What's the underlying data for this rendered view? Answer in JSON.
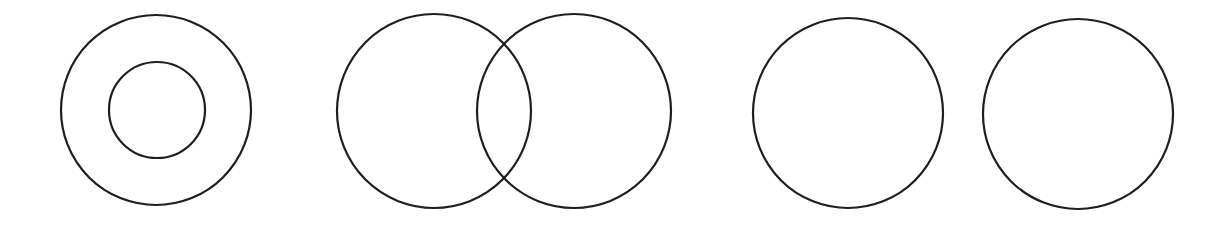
{
  "diagram": {
    "background": "#ffffff",
    "stroke_color": "#1e1e1e",
    "stroke_width": 2.2,
    "groups": [
      {
        "name": "concentric-circles",
        "circles": [
          {
            "cx": 156,
            "cy": 110,
            "r": 95
          },
          {
            "cx": 157,
            "cy": 110,
            "r": 48
          }
        ]
      },
      {
        "name": "overlapping-circles",
        "circles": [
          {
            "cx": 434,
            "cy": 111,
            "r": 97
          },
          {
            "cx": 574,
            "cy": 111,
            "r": 97
          }
        ]
      },
      {
        "name": "separate-circles",
        "circles": [
          {
            "cx": 848,
            "cy": 113,
            "r": 95
          },
          {
            "cx": 1078,
            "cy": 114,
            "r": 95
          }
        ]
      }
    ]
  }
}
